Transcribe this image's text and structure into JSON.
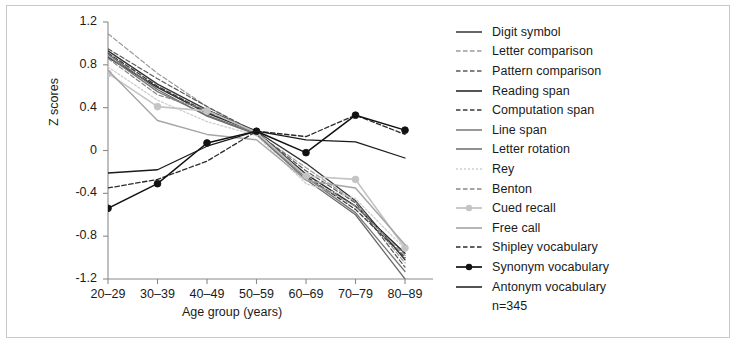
{
  "figure": {
    "note": "n=345",
    "border_color": "#c9c9c9"
  },
  "chart_data": {
    "type": "line",
    "title": "",
    "xlabel": "Age group (years)",
    "ylabel": "Z scores",
    "categories": [
      "20–29",
      "30–39",
      "40–49",
      "50–59",
      "60–69",
      "70–79",
      "80–89"
    ],
    "x_tick_labels": [
      "20–29",
      "30–39",
      "40–49",
      "50–59",
      "60–69",
      "70–79",
      "80–89"
    ],
    "y_tick_labels": [
      "1.2",
      "0.8",
      "0.4",
      "0",
      "-0.4",
      "-0.8",
      "-1.2"
    ],
    "y_ticks": [
      1.2,
      0.8,
      0.4,
      0,
      -0.4,
      -0.8,
      -1.2
    ],
    "ylim": [
      -1.2,
      1.2
    ],
    "grid": false,
    "legend_position": "right",
    "series": [
      {
        "name": "Digit symbol",
        "color": "#333333",
        "dash": "solid",
        "width": 1.3,
        "marker": "none",
        "values": [
          0.93,
          0.62,
          0.38,
          0.18,
          -0.12,
          -0.47,
          -1.02
        ]
      },
      {
        "name": "Letter comparison",
        "color": "#9a9a9a",
        "dash": "dashed",
        "width": 1.2,
        "marker": "none",
        "values": [
          1.09,
          0.72,
          0.41,
          0.16,
          -0.16,
          -0.48,
          -1.05
        ]
      },
      {
        "name": "Pattern comparison",
        "color": "#5a5a5a",
        "dash": "dashed",
        "width": 1.2,
        "marker": "none",
        "values": [
          0.95,
          0.67,
          0.41,
          0.17,
          -0.19,
          -0.49,
          -1.09
        ]
      },
      {
        "name": "Reading span",
        "color": "#2b2b2b",
        "dash": "solid",
        "width": 1.4,
        "marker": "none",
        "values": [
          0.87,
          0.59,
          0.35,
          0.17,
          -0.22,
          -0.52,
          -0.96
        ]
      },
      {
        "name": "Computation span",
        "color": "#3b3b3b",
        "dash": "dashed",
        "width": 1.3,
        "marker": "none",
        "values": [
          0.91,
          0.6,
          0.36,
          0.18,
          -0.24,
          -0.55,
          -1.0
        ]
      },
      {
        "name": "Line span",
        "color": "#777777",
        "dash": "solid",
        "width": 1.3,
        "marker": "none",
        "values": [
          0.88,
          0.55,
          0.33,
          0.16,
          -0.25,
          -0.58,
          -1.13
        ]
      },
      {
        "name": "Letter rotation",
        "color": "#6b6b6b",
        "dash": "solid",
        "width": 1.3,
        "marker": "none",
        "values": [
          0.9,
          0.57,
          0.32,
          0.15,
          -0.27,
          -0.6,
          -1.2
        ]
      },
      {
        "name": "Rey",
        "color": "#cfcfcf",
        "dash": "dotted",
        "width": 1.3,
        "marker": "none",
        "values": [
          0.78,
          0.47,
          0.27,
          0.14,
          -0.31,
          -0.45,
          -0.92
        ]
      },
      {
        "name": "Benton",
        "color": "#888888",
        "dash": "dashed",
        "width": 1.2,
        "marker": "none",
        "values": [
          0.86,
          0.52,
          0.38,
          0.16,
          -0.26,
          -0.52,
          -0.98
        ]
      },
      {
        "name": "Cued recall",
        "color": "#c4c4c4",
        "dash": "solid",
        "width": 1.6,
        "marker": "circle",
        "values": [
          0.72,
          0.41,
          0.37,
          0.17,
          -0.24,
          -0.27,
          -0.91
        ]
      },
      {
        "name": "Free call",
        "color": "#a5a5a5",
        "dash": "solid",
        "width": 1.4,
        "marker": "none",
        "values": [
          0.75,
          0.28,
          0.15,
          0.1,
          -0.28,
          -0.35,
          -0.88
        ]
      },
      {
        "name": "Shipley vocabulary",
        "color": "#2b2b2b",
        "dash": "dashed",
        "width": 1.3,
        "marker": "none",
        "values": [
          -0.35,
          -0.27,
          -0.1,
          0.18,
          0.13,
          0.33,
          0.15
        ]
      },
      {
        "name": "Synonym vocabulary",
        "color": "#111111",
        "dash": "solid",
        "width": 1.5,
        "marker": "circle",
        "values": [
          -0.54,
          -0.31,
          0.07,
          0.18,
          -0.02,
          0.33,
          0.19
        ]
      },
      {
        "name": "Antonym vocabulary",
        "color": "#1a1a1a",
        "dash": "solid",
        "width": 1.3,
        "marker": "none",
        "values": [
          -0.21,
          -0.18,
          0.04,
          0.18,
          0.1,
          0.08,
          -0.07
        ]
      }
    ]
  }
}
